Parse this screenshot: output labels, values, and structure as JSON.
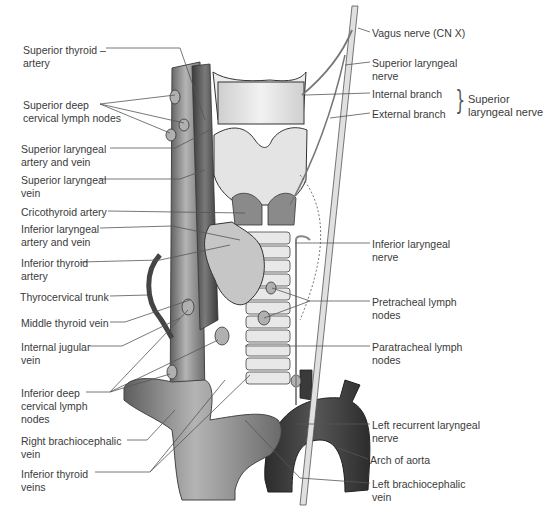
{
  "diagram": {
    "type": "anatomical-illustration",
    "colors": {
      "vein_light": "#9a9a9a",
      "vein_dark": "#5a5a5a",
      "aorta": "#3c3c3c",
      "cartilage": "#e6e6e6",
      "thyroid": "#c9c9c9",
      "nerve": "#dcdcdc",
      "leader_line": "#555555"
    }
  },
  "labels_left": [
    {
      "id": "superior-thyroid-artery",
      "text": "Superior thyroid –\nartery",
      "x": 23,
      "y": 44
    },
    {
      "id": "superior-deep-cervical-lymph-nodes",
      "text": "Superior deep\ncervical lymph nodes",
      "x": 23,
      "y": 99
    },
    {
      "id": "superior-laryngeal-artery-and-vein",
      "text": "Superior laryngeal\nartery and vein",
      "x": 21,
      "y": 143
    },
    {
      "id": "superior-laryngeal-vein",
      "text": "Superior laryngeal\nvein",
      "x": 21,
      "y": 174
    },
    {
      "id": "cricothyroid-artery",
      "text": "Cricothyroid artery",
      "x": 21,
      "y": 206
    },
    {
      "id": "inferior-laryngeal-artery-and-vein",
      "text": "Inferior laryngeal\nartery and vein",
      "x": 21,
      "y": 223
    },
    {
      "id": "inferior-thyroid-artery",
      "text": "Inferior thyroid\nartery",
      "x": 21,
      "y": 257
    },
    {
      "id": "thyrocervical-trunk",
      "text": "Thyrocervical trunk",
      "x": 20,
      "y": 291
    },
    {
      "id": "middle-thyroid-vein",
      "text": "Middle thyroid vein",
      "x": 21,
      "y": 317
    },
    {
      "id": "internal-jugular-vein",
      "text": "Internal jugular\nvein",
      "x": 21,
      "y": 341
    },
    {
      "id": "inferior-deep-cervical-lymph-nodes",
      "text": "Inferior deep\ncervical lymph\nnodes",
      "x": 21,
      "y": 387
    },
    {
      "id": "right-brachiocephalic-vein",
      "text": "Right brachiocephalic\nvein",
      "x": 21,
      "y": 435
    },
    {
      "id": "inferior-thyroid-veins",
      "text": "Inferior thyroid\nveins",
      "x": 21,
      "y": 468
    }
  ],
  "labels_right": [
    {
      "id": "vagus-nerve",
      "text": "Vagus nerve (CN X)",
      "x": 372,
      "y": 27
    },
    {
      "id": "superior-laryngeal-nerve",
      "text": "Superior laryngeal\nnerve",
      "x": 372,
      "y": 57
    },
    {
      "id": "internal-branch",
      "text": "Internal branch",
      "x": 372,
      "y": 88
    },
    {
      "id": "external-branch",
      "text": "External branch",
      "x": 372,
      "y": 108
    },
    {
      "id": "inferior-laryngeal-nerve",
      "text": "Inferior laryngeal\nnerve",
      "x": 372,
      "y": 238
    },
    {
      "id": "pretracheal-lymph-nodes",
      "text": "Pretracheal lymph\nnodes",
      "x": 372,
      "y": 296
    },
    {
      "id": "paratracheal-lymph-nodes",
      "text": "Paratracheal lymph\nnodes",
      "x": 372,
      "y": 341
    },
    {
      "id": "left-recurrent-laryngeal-nerve",
      "text": "Left recurrent laryngeal\nnerve",
      "x": 372,
      "y": 419
    },
    {
      "id": "arch-of-aorta",
      "text": "Arch of aorta",
      "x": 370,
      "y": 454
    },
    {
      "id": "left-brachiocephalic-vein",
      "text": "Left brachiocephalic\nvein",
      "x": 372,
      "y": 478
    }
  ],
  "brace_group": {
    "text": "Superior\nlaryngeal nerve",
    "x": 468,
    "y": 93,
    "brace_glyph": "}"
  }
}
